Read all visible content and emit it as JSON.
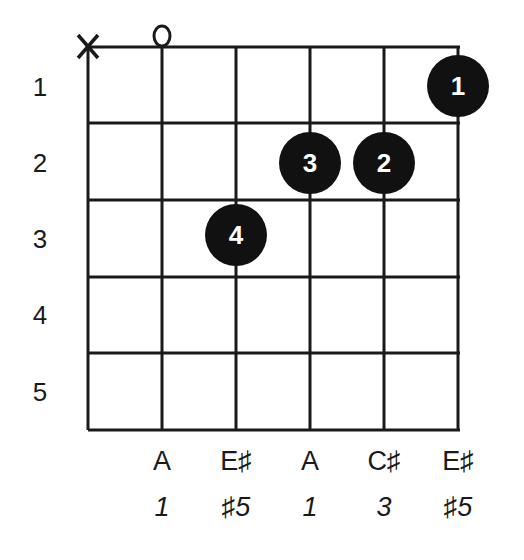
{
  "chord": {
    "strings": [
      "E",
      "A",
      "D",
      "G",
      "B",
      "E"
    ],
    "string_markers": [
      "X",
      "O",
      "",
      "",
      "",
      ""
    ],
    "fret_numbers": [
      "1",
      "2",
      "3",
      "4",
      "5"
    ],
    "fingers": [
      {
        "string": 6,
        "fret": 1,
        "finger": "1"
      },
      {
        "string": 5,
        "fret": 2,
        "finger": "2"
      },
      {
        "string": 4,
        "fret": 2,
        "finger": "3"
      },
      {
        "string": 3,
        "fret": 3,
        "finger": "4"
      }
    ],
    "notes": [
      "",
      "A",
      "E♯",
      "A",
      "C♯",
      "E♯"
    ],
    "intervals": [
      "",
      "1",
      "♯5",
      "1",
      "3",
      "♯5"
    ]
  },
  "colors": {
    "ink": "#1a1a1a",
    "dot": "#111111",
    "dot_text": "#ffffff"
  }
}
